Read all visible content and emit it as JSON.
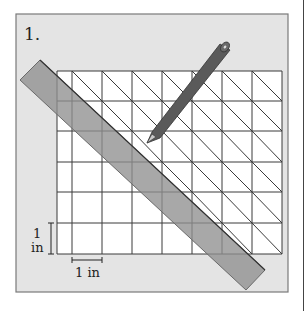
{
  "problem": {
    "number_label": "1.",
    "vertical_scale_label_1": "1",
    "vertical_scale_label_2": "in",
    "horizontal_scale_label": "1 in"
  },
  "grid": {
    "left": 57,
    "top": 71,
    "right": 282,
    "bottom": 254,
    "vertical_lines": [
      57,
      72,
      102,
      132,
      162,
      192,
      222,
      252,
      282
    ],
    "horizontal_lines": [
      71,
      101,
      131,
      162,
      192,
      223,
      254
    ]
  },
  "colors": {
    "panel_background": "#e4e4e4",
    "panel_border": "#7a7a7a",
    "grid_line": "#3a3a3a",
    "ruler_fill": "#9a9a9a",
    "pencil_fill": "#555555",
    "text": "#222222"
  },
  "objects": {
    "ruler": "straightedge-ruler",
    "pencil": "pencil"
  }
}
